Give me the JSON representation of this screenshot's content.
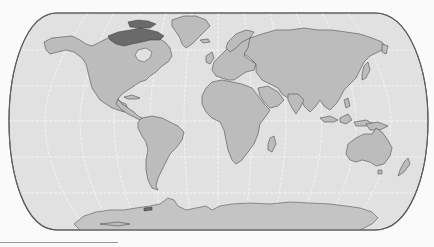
{
  "map": {
    "projection": "eckert-like pseudo-cylindrical (rounded poles)",
    "style": "grayscale",
    "colors": {
      "ocean": "#e1e1e1",
      "land": "#bcbcbc",
      "coastline": "#4f4f4f",
      "outline": "#5e5e5e",
      "graticule": "#ffffff",
      "highlight_region": "#6a6a6a",
      "background": "#fafafa"
    },
    "graticule": {
      "latitudes_deg": [
        -60,
        -30,
        0,
        30,
        60
      ],
      "longitude_step_deg": 30
    },
    "regions": [
      "North America",
      "Greenland",
      "South America",
      "Europe",
      "Africa",
      "Asia",
      "Australia",
      "Antarctica",
      "Canadian Arctic Archipelago (dark shading)"
    ]
  }
}
